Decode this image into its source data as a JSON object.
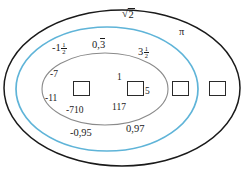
{
  "diagram": {
    "type": "venn-nested-ellipses",
    "title_visible": false,
    "colors": {
      "outer_ellipse": "#1a1a1a",
      "middle_ellipse": "#5fb4d8",
      "inner_ellipse": "#8a8a8a",
      "text": "#1a1a1a",
      "box_border": "#2a2a2a",
      "background": "#ffffff"
    },
    "regions": {
      "outer": {
        "name": "outer-region",
        "labels": [
          "sqrt2",
          "pi"
        ]
      },
      "middle": {
        "name": "middle-region",
        "labels": [
          "-1 1/2",
          "0,3 repeating",
          "3 1/2",
          "-0,95",
          "0,97"
        ]
      },
      "inner": {
        "name": "inner-region",
        "labels": [
          "-7",
          "-11",
          "-710",
          "1",
          "117",
          "5"
        ]
      }
    }
  },
  "labels": {
    "sqrt_sign": "√",
    "sqrt_radicand": "2",
    "pi": "π",
    "neg_one_whole": "-1",
    "neg_one_num": "1",
    "neg_one_den": "2",
    "zero_point": "0,",
    "zero_repeat": "3",
    "three_whole": "3",
    "three_num": "1",
    "three_den": "2",
    "neg_seven": "-7",
    "neg_eleven": "-11",
    "neg_710": "-710",
    "one": "1",
    "one_seventeen": "117",
    "five": "5",
    "neg_zero_95": "-0,95",
    "zero_97": "0,97"
  },
  "boxes": [
    {
      "name": "answer-box-1",
      "value": ""
    },
    {
      "name": "answer-box-2",
      "value": ""
    },
    {
      "name": "answer-box-3",
      "value": ""
    },
    {
      "name": "answer-box-4",
      "value": ""
    }
  ]
}
